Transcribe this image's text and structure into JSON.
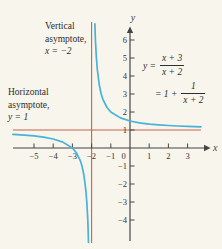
{
  "labels": {
    "vertical_asymptote": {
      "line1": "Vertical",
      "line2": "asymptote,",
      "line3": "x = −2"
    },
    "horizontal_asymptote": {
      "line1": "Horizontal",
      "line2": "asymptote,",
      "line3": "y = 1"
    }
  },
  "formula": {
    "line1_lhs": "y =",
    "line1_num": "x + 3",
    "line1_den": "x + 2",
    "line2_lhs": "= 1 +",
    "line2_num": "1",
    "line2_den": "x + 2"
  },
  "chart_data": {
    "type": "line",
    "title": "",
    "function": "y = (x + 3)/(x + 2) = 1 + 1/(x + 2)",
    "xlabel": "x",
    "ylabel": "y",
    "xlim": [
      -6.2,
      4.4
    ],
    "ylim": [
      -5.4,
      7.0
    ],
    "grid": false,
    "x_ticks": [
      -5,
      -4,
      -3,
      -2,
      -1,
      1,
      2,
      3
    ],
    "origin_label": "0",
    "y_ticks": [
      6,
      5,
      4,
      3,
      2,
      1,
      -1,
      -2,
      -3,
      -4
    ],
    "vertical_asymptote": {
      "x": -2,
      "label": "x = −2"
    },
    "horizontal_asymptote": {
      "y": 1,
      "label": "y = 1"
    },
    "x_intercept": [
      -3,
      0
    ],
    "y_intercept": [
      0,
      1.5
    ],
    "series": [
      {
        "name": "left-branch",
        "points": [
          [
            -6.1,
            0.76
          ],
          [
            -5.5,
            0.71
          ],
          [
            -5,
            0.67
          ],
          [
            -4.5,
            0.6
          ],
          [
            -4,
            0.5
          ],
          [
            -3.5,
            0.33
          ],
          [
            -3,
            0
          ],
          [
            -2.8,
            -0.25
          ],
          [
            -2.6,
            -0.67
          ],
          [
            -2.5,
            -1
          ],
          [
            -2.4,
            -1.5
          ],
          [
            -2.3,
            -2.33
          ],
          [
            -2.25,
            -3
          ],
          [
            -2.2,
            -4
          ],
          [
            -2.17,
            -4.88
          ],
          [
            -2.16,
            -5.25
          ]
        ]
      },
      {
        "name": "right-branch",
        "points": [
          [
            -1.83,
            6.9
          ],
          [
            -1.8,
            6
          ],
          [
            -1.75,
            5
          ],
          [
            -1.7,
            4.33
          ],
          [
            -1.6,
            3.5
          ],
          [
            -1.5,
            3
          ],
          [
            -1.4,
            2.67
          ],
          [
            -1.2,
            2.25
          ],
          [
            -1,
            2
          ],
          [
            -0.5,
            1.67
          ],
          [
            0,
            1.5
          ],
          [
            0.5,
            1.4
          ],
          [
            1,
            1.33
          ],
          [
            1.5,
            1.29
          ],
          [
            2,
            1.25
          ],
          [
            2.5,
            1.22
          ],
          [
            3,
            1.2
          ],
          [
            3.7,
            1.18
          ]
        ]
      }
    ],
    "colors": {
      "curve": "#48b2d8",
      "asymptote": "#c2654f",
      "axis": "#454545",
      "background": "#f8f5ec"
    }
  }
}
